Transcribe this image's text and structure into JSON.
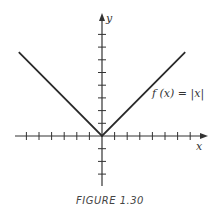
{
  "figure": {
    "caption": "FIGURE 1.30",
    "function_label": "f (x) = |x|",
    "x_axis_label": "x",
    "y_axis_label": "y",
    "colors": {
      "line": "#2a2a2a",
      "axis": "#333333",
      "background": "#ffffff"
    }
  },
  "chart_data": {
    "type": "line",
    "title": "FIGURE 1.30",
    "xlabel": "x",
    "ylabel": "y",
    "series": [
      {
        "name": "f(x) = |x|",
        "x": [
          -6.6,
          0,
          6.6
        ],
        "y": [
          6.6,
          0,
          6.6
        ]
      }
    ],
    "x_ticks": [
      -6,
      -5,
      -4,
      -3,
      -2,
      -1,
      1,
      2,
      3,
      4,
      5,
      6,
      7
    ],
    "y_ticks": [
      -3,
      -2,
      -1,
      1,
      2,
      3,
      4,
      5,
      6,
      7,
      8
    ],
    "xlim": [
      -7,
      8.5
    ],
    "ylim": [
      -4,
      9.6
    ],
    "grid": false,
    "tick_labels_shown": false,
    "annotations": [
      {
        "text": "f (x) = |x|",
        "x": 4.5,
        "y": 4.0
      }
    ]
  }
}
